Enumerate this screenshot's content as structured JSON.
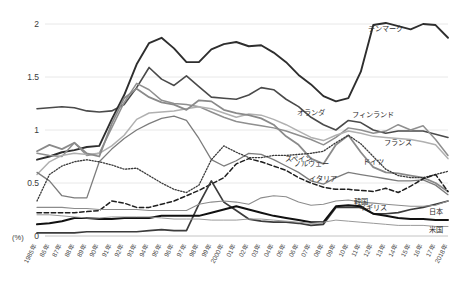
{
  "chart_data": {
    "type": "line",
    "title": "",
    "subtitle": "",
    "xlabel": "",
    "ylabel": "(%)",
    "unit_label": "(%)",
    "grid": true,
    "legend_position": "inline-right",
    "xlim": [
      1985,
      2018
    ],
    "ylim": [
      0,
      2.1
    ],
    "yticks": [
      0,
      0.5,
      1,
      1.5,
      2
    ],
    "ytick_labels": [
      "0",
      "0.5",
      "1",
      "1.5",
      "2"
    ],
    "x": [
      1985,
      1986,
      1987,
      1988,
      1989,
      1990,
      1991,
      1992,
      1993,
      1994,
      1995,
      1996,
      1997,
      1998,
      1999,
      2000,
      2001,
      2002,
      2003,
      2004,
      2005,
      2006,
      2007,
      2008,
      2009,
      2010,
      2011,
      2012,
      2013,
      2014,
      2015,
      2016,
      2017,
      2018
    ],
    "xtick_labels": [
      "1985年",
      "86年",
      "87年",
      "88年",
      "89年",
      "90年",
      "91年",
      "92年",
      "93年",
      "94年",
      "95年",
      "96年",
      "97年",
      "98年",
      "99年",
      "2000年",
      "01年",
      "02年",
      "03年",
      "04年",
      "05年",
      "06年",
      "07年",
      "08年",
      "09年",
      "10年",
      "11年",
      "12年",
      "13年",
      "14年",
      "15年",
      "16年",
      "17年",
      "2018年"
    ],
    "series": [
      {
        "name": "デンマーク",
        "name_en": "Denmark",
        "color": "#4a4a4a",
        "style": "solid",
        "width": 1.6,
        "label_x": 2013,
        "label_y": 1.93,
        "values": [
          1.2,
          1.21,
          1.22,
          1.21,
          1.18,
          1.17,
          1.18,
          1.24,
          1.4,
          1.59,
          1.48,
          1.42,
          1.51,
          1.41,
          1.31,
          1.3,
          1.29,
          1.33,
          1.4,
          1.38,
          1.29,
          1.22,
          1.12,
          1.05,
          1.0,
          1.09,
          1.07,
          1.0,
          0.97,
          0.99,
          0.99,
          0.99,
          0.96,
          0.93
        ]
      },
      {
        "name": "オランダ",
        "name_en": "Netherlands",
        "color": "#2e2e2e",
        "style": "solid",
        "width": 1.9,
        "label_x": 2007,
        "label_y": 1.14,
        "values": [
          0.72,
          0.75,
          0.79,
          0.81,
          0.84,
          0.85,
          1.1,
          1.33,
          1.62,
          1.82,
          1.87,
          1.77,
          1.64,
          1.64,
          1.76,
          1.81,
          1.83,
          1.79,
          1.8,
          1.73,
          1.64,
          1.52,
          1.43,
          1.32,
          1.27,
          1.3,
          1.55,
          1.99,
          2.01,
          1.98,
          1.95,
          2.0,
          1.99,
          1.87
        ]
      },
      {
        "name": "フィンランド",
        "name_en": "Finland",
        "color": "#8f8f8f",
        "style": "solid",
        "width": 1.5,
        "label_x": 2012,
        "label_y": 1.12,
        "values": [
          0.78,
          0.76,
          0.75,
          0.88,
          0.76,
          0.78,
          1.02,
          1.26,
          1.44,
          1.38,
          1.28,
          1.25,
          1.24,
          1.22,
          1.17,
          1.12,
          1.08,
          1.06,
          1.04,
          1.02,
          0.99,
          0.95,
          0.91,
          0.86,
          0.93,
          1.02,
          1.0,
          0.97,
          0.99,
          1.05,
          1.0,
          1.04,
          0.91,
          0.76
        ]
      },
      {
        "name": "フランス",
        "name_en": "France",
        "color": "#b0b0b0",
        "style": "solid",
        "width": 1.5,
        "label_x": 2014,
        "label_y": 0.86,
        "values": [
          0.58,
          0.7,
          0.76,
          0.78,
          0.77,
          0.78,
          0.85,
          0.95,
          1.1,
          1.16,
          1.17,
          1.18,
          1.2,
          1.22,
          1.2,
          1.16,
          1.12,
          1.15,
          1.14,
          1.1,
          1.05,
          0.99,
          0.93,
          0.9,
          0.95,
          0.99,
          0.97,
          0.94,
          0.93,
          0.92,
          0.91,
          0.89,
          0.86,
          0.73
        ]
      },
      {
        "name": "ドイツ",
        "name_en": "Germany",
        "color": "#8a8a8a",
        "style": "solid",
        "width": 1.8,
        "label_x": 2012,
        "label_y": 0.68,
        "values": [
          0.8,
          0.86,
          0.82,
          0.88,
          0.78,
          0.75,
          1.06,
          1.3,
          1.39,
          1.31,
          1.26,
          1.24,
          1.19,
          1.28,
          1.27,
          1.19,
          1.16,
          1.14,
          1.11,
          1.05,
          0.94,
          0.86,
          0.73,
          0.68,
          0.86,
          0.95,
          0.79,
          0.65,
          0.6,
          0.59,
          0.57,
          0.55,
          0.5,
          0.42
        ]
      },
      {
        "name": "ノルウェー",
        "name_en": "Norway",
        "color": "#7c7c7c",
        "style": "solid",
        "width": 1.3,
        "label_x": 2007,
        "label_y": 0.66,
        "values": [
          0.6,
          0.52,
          0.38,
          0.36,
          0.36,
          0.7,
          0.82,
          0.92,
          1.0,
          1.06,
          1.11,
          1.13,
          1.09,
          0.92,
          0.72,
          0.66,
          0.71,
          0.78,
          0.77,
          0.72,
          0.66,
          0.6,
          0.52,
          0.49,
          0.55,
          0.6,
          0.58,
          0.56,
          0.54,
          0.52,
          0.52,
          0.53,
          0.48,
          0.39
        ]
      },
      {
        "name": "スペイン",
        "name_en": "Spain",
        "color": "#3a3a3a",
        "style": "dotted",
        "width": 1.3,
        "label_x": 2006,
        "label_y": 0.71,
        "values": [
          0.33,
          0.58,
          0.66,
          0.7,
          0.72,
          0.7,
          0.67,
          0.63,
          0.64,
          0.57,
          0.5,
          0.44,
          0.41,
          0.48,
          0.72,
          0.85,
          0.79,
          0.74,
          0.74,
          0.76,
          0.76,
          0.77,
          0.78,
          0.8,
          0.88,
          0.95,
          0.87,
          0.75,
          0.63,
          0.57,
          0.55,
          0.55,
          0.58,
          0.61
        ]
      },
      {
        "name": "イタリア",
        "name_en": "Italy",
        "color": "#1e1e1e",
        "style": "dashed",
        "width": 1.5,
        "label_x": 2008,
        "label_y": 0.52,
        "values": [
          0.22,
          0.22,
          0.22,
          0.22,
          0.23,
          0.24,
          0.33,
          0.31,
          0.27,
          0.27,
          0.3,
          0.33,
          0.38,
          0.43,
          0.49,
          0.55,
          0.68,
          0.73,
          0.7,
          0.66,
          0.62,
          0.55,
          0.5,
          0.46,
          0.44,
          0.44,
          0.43,
          0.42,
          0.45,
          0.41,
          0.47,
          0.54,
          0.58,
          0.42
        ]
      },
      {
        "name": "韓国",
        "name_en": "South Korea",
        "color": "#3c3c3c",
        "style": "solid",
        "width": 1.7,
        "label_x": 2011,
        "label_y": 0.3,
        "values": [
          0.03,
          0.03,
          0.03,
          0.03,
          0.04,
          0.04,
          0.04,
          0.04,
          0.04,
          0.05,
          0.06,
          0.05,
          0.05,
          0.3,
          0.52,
          0.32,
          0.24,
          0.16,
          0.14,
          0.13,
          0.13,
          0.12,
          0.1,
          0.11,
          0.27,
          0.27,
          0.27,
          0.21,
          0.21,
          0.22,
          0.25,
          0.27,
          0.3,
          0.33
        ]
      },
      {
        "name": "イギリス",
        "name_en": "United Kingdom",
        "color": "#8c8c8c",
        "style": "solid",
        "width": 1.1,
        "label_x": 2012,
        "label_y": 0.25,
        "values": [
          0.27,
          0.27,
          0.27,
          0.26,
          0.26,
          0.25,
          0.25,
          0.25,
          0.25,
          0.24,
          0.24,
          0.24,
          0.24,
          0.3,
          0.32,
          0.33,
          0.32,
          0.3,
          0.36,
          0.38,
          0.37,
          0.32,
          0.29,
          0.3,
          0.33,
          0.34,
          0.32,
          0.31,
          0.3,
          0.29,
          0.28,
          0.28,
          0.29,
          0.33
        ]
      },
      {
        "name": "日本",
        "name_en": "Japan",
        "color": "#111111",
        "style": "solid",
        "width": 2.0,
        "label_x": 2017,
        "label_y": 0.21,
        "values": [
          0.11,
          0.12,
          0.14,
          0.17,
          0.17,
          0.16,
          0.16,
          0.17,
          0.17,
          0.17,
          0.19,
          0.19,
          0.19,
          0.19,
          0.22,
          0.25,
          0.28,
          0.25,
          0.22,
          0.19,
          0.17,
          0.15,
          0.13,
          0.13,
          0.28,
          0.29,
          0.28,
          0.21,
          0.19,
          0.17,
          0.16,
          0.16,
          0.15,
          0.15
        ]
      },
      {
        "name": "米国",
        "name_en": "United States",
        "color": "#9a9a9a",
        "style": "solid",
        "width": 1.0,
        "label_x": 2017,
        "label_y": 0.04,
        "values": [
          0.2,
          0.2,
          0.19,
          0.18,
          0.17,
          0.17,
          0.18,
          0.18,
          0.18,
          0.18,
          0.17,
          0.16,
          0.16,
          0.16,
          0.15,
          0.15,
          0.15,
          0.16,
          0.16,
          0.15,
          0.14,
          0.13,
          0.12,
          0.13,
          0.15,
          0.14,
          0.13,
          0.12,
          0.11,
          0.1,
          0.1,
          0.1,
          0.09,
          0.09
        ]
      }
    ]
  }
}
